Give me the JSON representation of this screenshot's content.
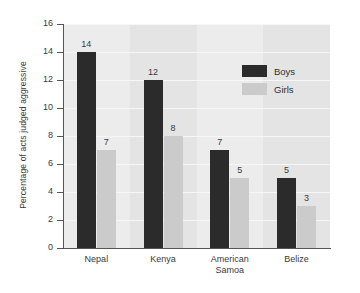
{
  "chart_data": {
    "type": "bar",
    "title": "",
    "xlabel": "",
    "ylabel": "Percentage of acts judged aggressive",
    "categories": [
      "Nepal",
      "Kenya",
      "American Samoa",
      "Belize"
    ],
    "category_lines": [
      [
        "Nepal"
      ],
      [
        "Kenya"
      ],
      [
        "American",
        "Samoa"
      ],
      [
        "Belize"
      ]
    ],
    "series": [
      {
        "name": "Boys",
        "color": "#2b2b2b",
        "values": [
          14,
          12,
          7,
          5
        ]
      },
      {
        "name": "Girls",
        "color": "#cbcbcb",
        "values": [
          7,
          8,
          5,
          3
        ]
      }
    ],
    "ylim": [
      0,
      16
    ],
    "ytick_labels": [
      "16",
      "14",
      "12",
      "10",
      "8",
      "6",
      "4",
      "2",
      "0"
    ],
    "ytick_values": [
      16,
      14,
      12,
      10,
      8,
      6,
      4,
      2,
      0
    ],
    "grid": true,
    "legend_position": "upper-right",
    "plot_background": "#ececec"
  },
  "legend": {
    "entries": [
      {
        "label": "Boys"
      },
      {
        "label": "Girls"
      }
    ]
  }
}
